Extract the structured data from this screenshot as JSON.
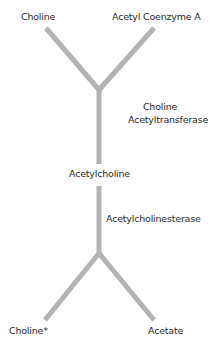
{
  "diagram": {
    "line_color": "#b3b3b3",
    "text_color": "#2a2a2a",
    "nodes": {
      "top_left": "Choline",
      "top_right": "Acetyl Coenzyme A",
      "middle": "Acetylcholine",
      "bottom_left": "Choline*",
      "bottom_right": "Acetate"
    },
    "enzymes": {
      "synthesis_line1": "Choline",
      "synthesis_line2": "Acetyltransferase",
      "breakdown": "Acetylcholinesterase"
    }
  }
}
